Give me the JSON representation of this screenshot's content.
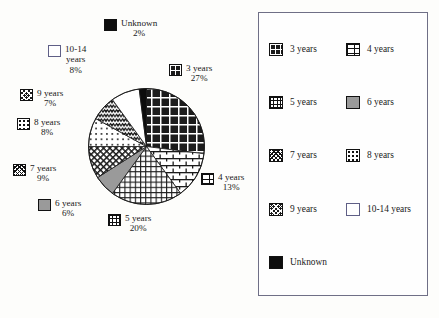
{
  "chart_data": {
    "type": "pie",
    "title": "",
    "xlabel": "",
    "ylabel": "",
    "legend_position": "right",
    "grid": false,
    "categories": [
      "3 years",
      "4 years",
      "5 years",
      "6 years",
      "7 years",
      "8 years",
      "9 years",
      "10-14 years",
      "Unknown"
    ],
    "values": [
      27,
      13,
      20,
      6,
      9,
      8,
      7,
      8,
      2
    ],
    "value_labels": [
      "27%",
      "13%",
      "20%",
      "6%",
      "9%",
      "8%",
      "7%",
      "8%",
      "2%"
    ],
    "units": "percent",
    "start_angle_deg": 0,
    "direction": "clockwise",
    "slices": [
      {
        "label": "3 years",
        "value": 27,
        "value_label": "27%",
        "pattern": "sw-grid-coarse",
        "start_deg": 0,
        "end_deg": 97.2
      },
      {
        "label": "4 years",
        "value": 13,
        "value_label": "13%",
        "pattern": "sw-brick",
        "start_deg": 97.2,
        "end_deg": 144.0
      },
      {
        "label": "5 years",
        "value": 20,
        "value_label": "20%",
        "pattern": "sw-grid-fine",
        "start_deg": 144.0,
        "end_deg": 216.0
      },
      {
        "label": "6 years",
        "value": 6,
        "value_label": "6%",
        "pattern": "sw-solid-gray",
        "start_deg": 216.0,
        "end_deg": 237.6
      },
      {
        "label": "7 years",
        "value": 9,
        "value_label": "9%",
        "pattern": "sw-xhatch",
        "start_deg": 237.6,
        "end_deg": 270.0
      },
      {
        "label": "8 years",
        "value": 8,
        "value_label": "8%",
        "pattern": "sw-dots",
        "start_deg": 270.0,
        "end_deg": 298.8
      },
      {
        "label": "9 years",
        "value": 7,
        "value_label": "7%",
        "pattern": "sw-wave",
        "start_deg": 298.8,
        "end_deg": 324.0
      },
      {
        "label": "10-14 years",
        "value": 8,
        "value_label": "8%",
        "pattern": "sw-white",
        "start_deg": 324.0,
        "end_deg": 352.8
      },
      {
        "label": "Unknown",
        "value": 2,
        "value_label": "2%",
        "pattern": "sw-black",
        "start_deg": 352.8,
        "end_deg": 360.0
      }
    ]
  },
  "callouts": [
    {
      "name": "unknown",
      "line1": "Unknown",
      "line2": "",
      "pct": "2%",
      "pattern": "sw-black"
    },
    {
      "name": "ten-to-fourteen",
      "line1": "10-14",
      "line2": "years",
      "pct": "8%",
      "pattern": "sw-white"
    },
    {
      "name": "nine",
      "line1": "9 years",
      "line2": "",
      "pct": "7%",
      "pattern": "sw-wave"
    },
    {
      "name": "eight",
      "line1": "8 years",
      "line2": "",
      "pct": "8%",
      "pattern": "sw-dots"
    },
    {
      "name": "seven",
      "line1": "7 years",
      "line2": "",
      "pct": "9%",
      "pattern": "sw-xhatch"
    },
    {
      "name": "six",
      "line1": "6 years",
      "line2": "",
      "pct": "6%",
      "pattern": "sw-solid-gray"
    },
    {
      "name": "five",
      "line1": "5 years",
      "line2": "",
      "pct": "20%",
      "pattern": "sw-grid-fine"
    },
    {
      "name": "four",
      "line1": "4 years",
      "line2": "",
      "pct": "13%",
      "pattern": "sw-brick"
    },
    {
      "name": "three",
      "line1": "3 years",
      "line2": "",
      "pct": "27%",
      "pattern": "sw-grid-coarse"
    }
  ],
  "legend": {
    "items": [
      {
        "label": "3 years",
        "pattern": "sw-grid-coarse"
      },
      {
        "label": "4 years",
        "pattern": "sw-brick"
      },
      {
        "label": "5 years",
        "pattern": "sw-grid-fine"
      },
      {
        "label": "6 years",
        "pattern": "sw-solid-gray"
      },
      {
        "label": "7 years",
        "pattern": "sw-xhatch"
      },
      {
        "label": "8 years",
        "pattern": "sw-dots"
      },
      {
        "label": "9 years",
        "pattern": "sw-wave"
      },
      {
        "label": "10-14 years",
        "pattern": "sw-white"
      },
      {
        "label": "Unknown",
        "pattern": "sw-black"
      }
    ]
  },
  "colors": {
    "ink": "#1a1a1a",
    "page": "#fdfdfb",
    "legend_border": "#6f6f86",
    "gray_fill": "#9a9a9a",
    "black_fill": "#0d0d0d",
    "white_fill": "#ffffff"
  }
}
